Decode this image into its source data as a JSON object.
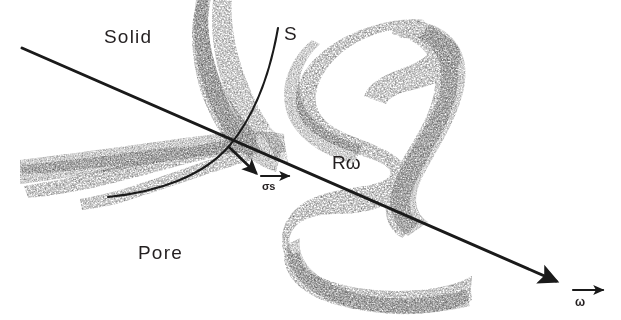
{
  "figure": {
    "width": 621,
    "height": 320,
    "background_color": "#ffffff",
    "ink_color": "#1a1a1a"
  },
  "labels": {
    "solid": "Solid",
    "pore": "Pore",
    "surface": "S",
    "radius": "Rω",
    "normal": "σs",
    "omega": "ω"
  },
  "elements": {
    "solid_region_label": "Solid",
    "pore_region_label": "Pore",
    "interface_curve_label": "S",
    "radius_vector_label": "Rω",
    "normal_vector_label": "σs",
    "direction_vector_label": "ω"
  },
  "geometry": {
    "main_arrow": {
      "x1": 22,
      "y1": 48,
      "x2": 560,
      "y2": 283
    },
    "normal_arrow": {
      "x1": 228,
      "y1": 146,
      "x2": 262,
      "y2": 178
    },
    "omega_key_arrow": {
      "x1": 573,
      "y1": 290,
      "x2": 607,
      "y2": 290
    },
    "sigma_key_arrow": {
      "x1": 261,
      "y1": 176,
      "x2": 293,
      "y2": 176
    },
    "interface_arc": "M 277 30 C 268 78 252 118 228 146 C 200 176 155 192 108 198"
  }
}
